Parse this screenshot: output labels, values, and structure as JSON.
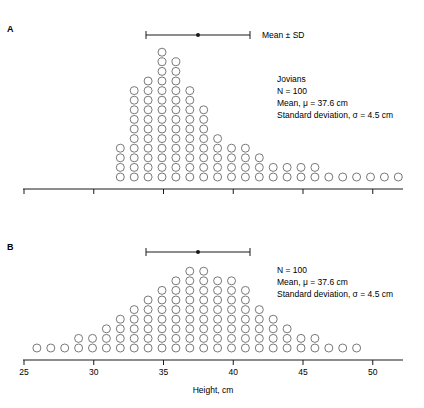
{
  "chart_data": [
    {
      "type": "dot-histogram",
      "panel": "A",
      "title": "",
      "xlabel": "",
      "ylabel": "",
      "xlim": [
        25,
        52
      ],
      "xticks": [
        25,
        30,
        35,
        40,
        45,
        50
      ],
      "tick_labels_shown": false,
      "mean_sd_bar": {
        "mean": 37.6,
        "sd": 4.5,
        "label": "Mean ± SD"
      },
      "annotation": [
        "Jovians",
        "N = 100",
        "Mean, μ = 37.6 cm",
        "Standard deviation, σ = 4.5 cm"
      ],
      "x": [
        32,
        33,
        34,
        35,
        36,
        37,
        38,
        39,
        40,
        41,
        42,
        43,
        44,
        45,
        46,
        47,
        48,
        49,
        50,
        51,
        52
      ],
      "counts": [
        4,
        10,
        11,
        14,
        13,
        10,
        8,
        5,
        4,
        4,
        3,
        2,
        2,
        2,
        2,
        1,
        1,
        1,
        1,
        1,
        1
      ]
    },
    {
      "type": "dot-histogram",
      "panel": "B",
      "title": "",
      "xlabel": "Height, cm",
      "ylabel": "",
      "xlim": [
        25,
        52
      ],
      "xticks": [
        25,
        30,
        35,
        40,
        45,
        50
      ],
      "tick_labels_shown": true,
      "mean_sd_bar": {
        "mean": 37.6,
        "sd": 4.5,
        "label": ""
      },
      "annotation": [
        "N = 100",
        "Mean, μ = 37.6 cm",
        "Standard deviation, σ = 4.5 cm"
      ],
      "x": [
        26,
        27,
        28,
        29,
        30,
        31,
        32,
        33,
        34,
        35,
        36,
        37,
        38,
        39,
        40,
        41,
        42,
        43,
        44,
        45,
        46,
        47,
        48,
        49
      ],
      "counts": [
        1,
        1,
        1,
        2,
        2,
        3,
        4,
        5,
        6,
        7,
        8,
        9,
        9,
        8,
        8,
        7,
        5,
        4,
        3,
        2,
        2,
        1,
        1,
        1
      ]
    }
  ],
  "panels": {
    "a": {
      "label": "A",
      "legend": "Mean ± SD",
      "info": [
        "Jovians",
        "N = 100",
        "Mean, μ = 37.6 cm",
        "Standard deviation, σ = 4.5 cm"
      ]
    },
    "b": {
      "label": "B",
      "info": [
        "N = 100",
        "Mean, μ = 37.6 cm",
        "Standard deviation, σ = 4.5 cm"
      ]
    }
  },
  "axis": {
    "tick_labels": [
      "25",
      "30",
      "35",
      "40",
      "45",
      "50"
    ],
    "xlabel": "Height, cm"
  },
  "style": {
    "ink": "#1a1a1a",
    "dot_stroke": "#6a6a6a"
  }
}
